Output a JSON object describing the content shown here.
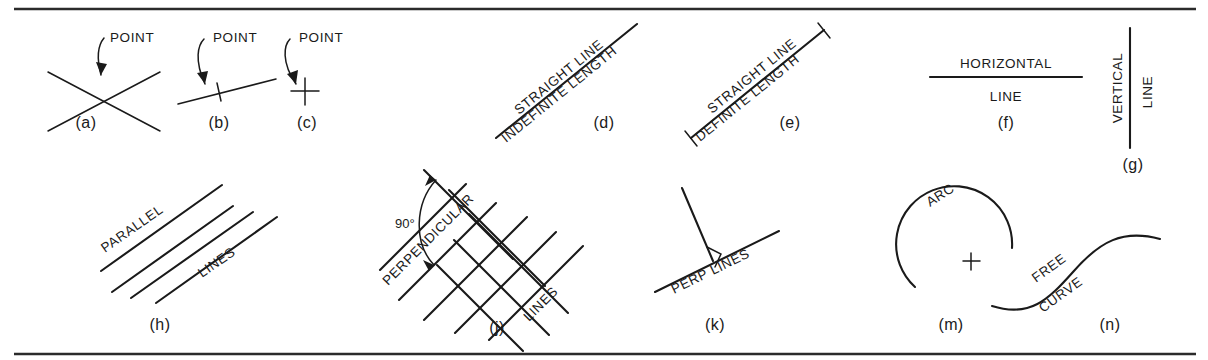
{
  "plate": {
    "title": "Geometric elements of technical drawing",
    "background_color": "#ffffff",
    "ink_color": "#1a1a1a",
    "rule_color": "#2b2b2b",
    "width": 1208,
    "height": 360
  },
  "figures": {
    "a": {
      "key": "(a)",
      "label": "POINT",
      "description": "two crossing straight lines meeting at a point"
    },
    "b": {
      "key": "(b)",
      "label": "POINT",
      "description": "a short tick crossing a single straight line"
    },
    "c": {
      "key": "(c)",
      "label": "POINT",
      "description": "a small cross mark alone"
    },
    "d": {
      "key": "(d)",
      "label_top": "STRAIGHT LINE",
      "label_bottom": "INDEFINITE LENGTH",
      "description": "inclined straight line with no end caps"
    },
    "e": {
      "key": "(e)",
      "label_top": "STRAIGHT LINE",
      "label_bottom": "DEFINITE LENGTH",
      "description": "inclined straight line capped with end ticks"
    },
    "f": {
      "key": "(f)",
      "label_top": "HORIZONTAL",
      "label_bottom": "LINE",
      "description": "a horizontal straight line"
    },
    "g": {
      "key": "(g)",
      "label_left": "VERTICAL",
      "label_right": "LINE",
      "description": "a vertical straight line"
    },
    "h": {
      "key": "(h)",
      "label_top": "PARALLEL",
      "label_bottom": "LINES",
      "line_count": 4,
      "description": "four equally spaced parallel inclined lines"
    },
    "j": {
      "key": "(j)",
      "label_top": "PERPENDICULAR",
      "label_bottom": "LINES",
      "angle": "90°",
      "description": "a lattice of two sets of lines crossing at right angles"
    },
    "k": {
      "key": "(k)",
      "label": "PERP LINES",
      "description": "two lines meeting at a right angle with square corner mark"
    },
    "m": {
      "key": "(m)",
      "label": "ARC",
      "description": "a circular arc with its centre marked by a small cross"
    },
    "n": {
      "key": "(n)",
      "label_top": "FREE",
      "label_bottom": "CURVE",
      "description": "an irregular S-shaped free curve"
    }
  }
}
